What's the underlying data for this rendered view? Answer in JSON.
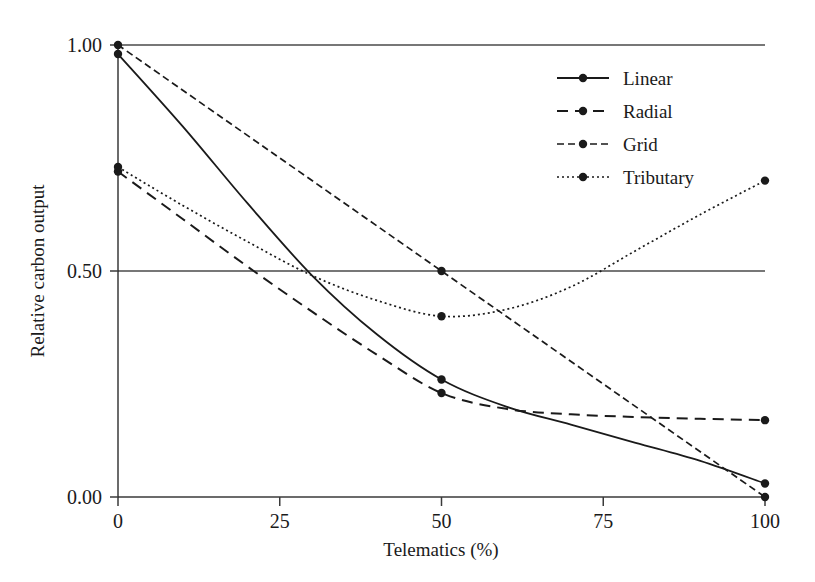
{
  "chart_data": {
    "type": "line",
    "title": "",
    "xlabel": "Telematics (%)",
    "ylabel": "Relative carbon output",
    "xlim": [
      0,
      100
    ],
    "ylim": [
      0,
      1.0
    ],
    "xticks": [
      0,
      25,
      50,
      75,
      100
    ],
    "xtick_labels": [
      "0",
      "25",
      "50",
      "75",
      "100"
    ],
    "yticks": [
      0.0,
      0.5,
      1.0
    ],
    "ytick_labels": [
      "0.00",
      "0.50",
      "1.00"
    ],
    "grid": "horizontal gridlines at y = 0.50 and y = 1.00",
    "legend_position": "top-right",
    "marker_x": [
      0,
      50,
      100
    ],
    "series": [
      {
        "name": "Linear",
        "style": "solid",
        "dash": "none",
        "color": "#1a1a1a",
        "x": [
          0,
          50,
          100
        ],
        "values": [
          0.98,
          0.26,
          0.03
        ],
        "curve_x": [
          0,
          10,
          20,
          30,
          40,
          50,
          60,
          70,
          80,
          90,
          100
        ],
        "curve_y": [
          0.98,
          0.82,
          0.65,
          0.49,
          0.36,
          0.26,
          0.2,
          0.16,
          0.12,
          0.08,
          0.03
        ]
      },
      {
        "name": "Radial",
        "style": "dashed",
        "dash": "11,7",
        "color": "#1a1a1a",
        "x": [
          0,
          50,
          100
        ],
        "values": [
          0.72,
          0.23,
          0.17
        ],
        "curve_x": [
          0,
          10,
          20,
          30,
          40,
          50,
          60,
          70,
          80,
          90,
          100
        ],
        "curve_y": [
          0.72,
          0.615,
          0.51,
          0.41,
          0.315,
          0.23,
          0.195,
          0.183,
          0.177,
          0.173,
          0.17
        ]
      },
      {
        "name": "Grid",
        "style": "dash-dot",
        "dash": "7,4",
        "color": "#1a1a1a",
        "x": [
          0,
          50,
          100
        ],
        "values": [
          1.0,
          0.5,
          0.0
        ],
        "curve_x": [
          0,
          50,
          100
        ],
        "curve_y": [
          1.0,
          0.5,
          0.0
        ]
      },
      {
        "name": "Tributary",
        "style": "dotted",
        "dash": "2,3",
        "color": "#1a1a1a",
        "x": [
          0,
          50,
          100
        ],
        "values": [
          0.73,
          0.4,
          0.7
        ],
        "curve_x": [
          0,
          10,
          20,
          30,
          40,
          50,
          60,
          70,
          80,
          90,
          100
        ],
        "curve_y": [
          0.73,
          0.645,
          0.565,
          0.49,
          0.435,
          0.4,
          0.415,
          0.465,
          0.545,
          0.625,
          0.7
        ]
      }
    ]
  },
  "legend": {
    "items": [
      {
        "label": "Linear"
      },
      {
        "label": "Radial"
      },
      {
        "label": "Grid"
      },
      {
        "label": "Tributary"
      }
    ]
  }
}
